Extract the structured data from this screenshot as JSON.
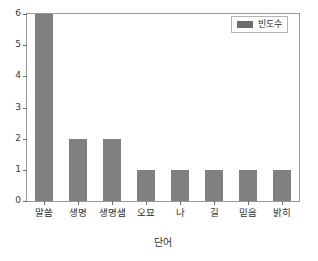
{
  "chart_data": {
    "type": "bar",
    "title": "",
    "subtitle": "",
    "categories": [
      "말씀",
      "생명",
      "생명샘",
      "오묘",
      "나",
      "길",
      "믿음",
      "밝히"
    ],
    "values": [
      6,
      2,
      2,
      1,
      1,
      1,
      1,
      1
    ],
    "series": [
      {
        "name": "빈도수",
        "values": [
          6,
          2,
          2,
          1,
          1,
          1,
          1,
          1
        ],
        "color": "#808080"
      }
    ],
    "xlabel": "단어",
    "ylabel": "",
    "ylim": [
      0,
      6
    ],
    "yticks": [
      0,
      1,
      2,
      3,
      4,
      5,
      6
    ],
    "ytick_labels": [
      "0",
      "1",
      "2",
      "3",
      "4",
      "5",
      "6"
    ],
    "grid": false,
    "legend_position": "upper right",
    "legend_entries": [
      "빈도수"
    ],
    "annotations": []
  },
  "legend": {
    "label": "빈도수",
    "swatch_color": "#6d6d6d"
  },
  "axes": {
    "x_title": "단어",
    "y_title": ""
  },
  "colors": {
    "bar": "#808080",
    "frame": "#9a9a9a",
    "text": "#2f2f2f",
    "background": "#ffffff"
  }
}
